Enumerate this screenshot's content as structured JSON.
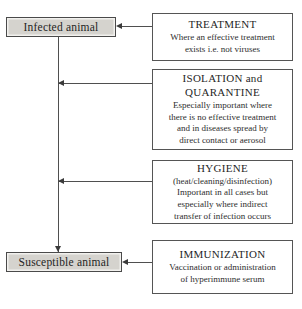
{
  "diagram": {
    "type": "flowchart",
    "states": [
      {
        "id": "infected",
        "label": "Infected animal",
        "fill": "#d5d3ce",
        "border": "#4a4a4a"
      },
      {
        "id": "susceptible",
        "label": "Susceptible animal",
        "fill": "#d5d3ce",
        "border": "#4a4a4a"
      }
    ],
    "interventions": [
      {
        "id": "treatment",
        "title": "TREATMENT",
        "desc_lines": [
          "Where an effective treatment",
          "exists i.e. not viruses"
        ],
        "target": "Infected animal"
      },
      {
        "id": "isolation",
        "title_lines": [
          "ISOLATION and",
          "QUARANTINE"
        ],
        "desc_lines": [
          "Especially important where",
          "there is no effective treatment",
          "and in diseases spread by",
          "direct contact or aerosol"
        ],
        "target": "transmission pathway"
      },
      {
        "id": "hygiene",
        "title": "HYGIENE",
        "desc_lines": [
          "(heat/cleaning/disinfection)",
          "Important in all cases but",
          "especially where indirect",
          "transfer of infection occurs"
        ],
        "target": "transmission pathway"
      },
      {
        "id": "immunization",
        "title": "IMMUNIZATION",
        "desc_lines": [
          "Vaccination or administration",
          "of hyperimmune serum"
        ],
        "target": "Susceptible animal"
      }
    ],
    "connectors": [
      {
        "id": "trunk",
        "from": "Infected animal",
        "to": "Susceptible animal",
        "direction": "down",
        "arrow": true
      },
      {
        "id": "treatment-arrow",
        "from": "TREATMENT",
        "to": "Infected animal",
        "direction": "left",
        "arrow": true
      },
      {
        "id": "isolation-arrow",
        "from": "ISOLATION and QUARANTINE",
        "to": "transmission pathway",
        "direction": "left",
        "arrow": true
      },
      {
        "id": "hygiene-arrow",
        "from": "HYGIENE",
        "to": "transmission pathway",
        "direction": "left",
        "arrow": true
      },
      {
        "id": "immunization-arrow",
        "from": "IMMUNIZATION",
        "to": "Susceptible animal",
        "direction": "left",
        "arrow": true
      }
    ],
    "colors": {
      "background": "#ffffff",
      "state_fill": "#d5d3ce",
      "state_border": "#4a4a4a",
      "action_border": "#555555",
      "connector": "#4f4f4f",
      "arrowhead": "#3b3b3b",
      "text": "#1f1f1f"
    }
  }
}
